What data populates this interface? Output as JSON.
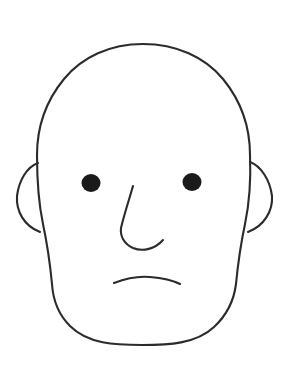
{
  "meta": {
    "width": 288,
    "height": 379
  },
  "colors": {
    "background": "#ffffff",
    "stroke": "#2b2b2b",
    "eye_fill": "#1a1a1a"
  },
  "style": {
    "stroke_width": 2.1,
    "eye_stroke_width": 0,
    "linecap": "round",
    "linejoin": "round"
  },
  "drawing": {
    "type": "line-art",
    "viewbox": "0 0 288 379",
    "parts": [
      {
        "name": "head-outline",
        "label": "Head and jaw contour",
        "path": "M 143 44 C 110 44 82 57 64 79 C 46 101 37 128 37 155 C 37 180 39 205 43 224 C 47 243 50 263 52 284 C 53 300 58 314 70 326 C 88 344 115 345 142 345 C 168 345 196 344 214 327 C 228 314 234 300 236 284 C 238 263 241 243 245 224 C 249 205 251 180 250 155 C 250 128 241 101 223 79 C 205 57 176 44 143 44 Z"
      },
      {
        "name": "left-ear",
        "label": "Left ear",
        "path": "M 38 163 C 27 167 19 180 17 196 C 16 211 24 226 40 232"
      },
      {
        "name": "right-ear",
        "label": "Right ear",
        "path": "M 250 162 C 261 166 270 180 272 196 C 273 211 264 226 248 232"
      },
      {
        "name": "left-eye",
        "label": "Left eye",
        "shape": "ellipse",
        "cx": 91,
        "cy": 183,
        "rx": 9.5,
        "ry": 9.0
      },
      {
        "name": "right-eye",
        "label": "Right eye",
        "shape": "ellipse",
        "cx": 192,
        "cy": 182,
        "rx": 9.5,
        "ry": 9.0
      },
      {
        "name": "nose",
        "label": "Nose bridge and nostril curve",
        "path": "M 133 186 C 129 200 124 215 121 228 C 120 236 124 244 133 248 C 143 252 155 249 163 240"
      },
      {
        "name": "mouth",
        "label": "Mouth (slight frown)",
        "path": "M 114 283 C 127 278 140 276 150 277 C 162 278 172 280 180 284"
      }
    ]
  }
}
